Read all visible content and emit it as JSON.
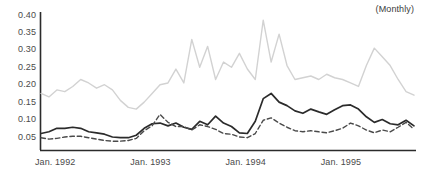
{
  "annotation": {
    "frequency_note": "(Monthly)"
  },
  "chart_data": {
    "type": "line",
    "title": "",
    "subtitle": "",
    "xlabel": "",
    "ylabel": "",
    "annotations": [
      "(Monthly)"
    ],
    "grid": false,
    "legend": "none",
    "ylim": [
      0.0,
      0.4
    ],
    "ytick_labels": [
      "0.40",
      "0.35",
      "0.30",
      "0.25",
      "0.20",
      "0.15",
      "0.10",
      "0.05"
    ],
    "yticks": [
      0.4,
      0.35,
      0.3,
      0.25,
      0.2,
      0.15,
      0.1,
      0.05
    ],
    "xtick_labels": [
      "Jan. 1992",
      "Jan. 1993",
      "Jan. 1994",
      "Jan. 1995"
    ],
    "xticks": [
      0,
      12,
      24,
      36
    ],
    "x_index": [
      0,
      1,
      2,
      3,
      4,
      5,
      6,
      7,
      8,
      9,
      10,
      11,
      12,
      13,
      14,
      15,
      16,
      17,
      18,
      19,
      20,
      21,
      22,
      23,
      24,
      25,
      26,
      27,
      28,
      29,
      30,
      31,
      32,
      33,
      34,
      35,
      36,
      37,
      38,
      39,
      40,
      41,
      42,
      43,
      44,
      45,
      46,
      47
    ],
    "series": [
      {
        "name": "light-gray-series",
        "style": "solid",
        "color": "#d2d2d2",
        "values": [
          0.175,
          0.165,
          0.185,
          0.18,
          0.195,
          0.215,
          0.205,
          0.19,
          0.2,
          0.185,
          0.155,
          0.135,
          0.13,
          0.15,
          0.175,
          0.2,
          0.205,
          0.245,
          0.205,
          0.33,
          0.25,
          0.31,
          0.215,
          0.265,
          0.25,
          0.29,
          0.245,
          0.215,
          0.385,
          0.265,
          0.345,
          0.255,
          0.215,
          0.22,
          0.225,
          0.215,
          0.23,
          0.22,
          0.215,
          0.205,
          0.195,
          0.255,
          0.305,
          0.28,
          0.255,
          0.215,
          0.18,
          0.17
        ]
      },
      {
        "name": "dark-solid-series",
        "style": "solid",
        "color": "#2b2b2b",
        "values": [
          0.06,
          0.065,
          0.075,
          0.075,
          0.078,
          0.075,
          0.065,
          0.062,
          0.058,
          0.05,
          0.048,
          0.048,
          0.055,
          0.075,
          0.088,
          0.09,
          0.082,
          0.09,
          0.078,
          0.072,
          0.095,
          0.085,
          0.11,
          0.09,
          0.08,
          0.062,
          0.06,
          0.095,
          0.16,
          0.175,
          0.15,
          0.14,
          0.125,
          0.118,
          0.13,
          0.122,
          0.115,
          0.128,
          0.14,
          0.142,
          0.13,
          0.108,
          0.092,
          0.1,
          0.088,
          0.085,
          0.098,
          0.082
        ]
      },
      {
        "name": "dark-dashed-series",
        "style": "dashed",
        "color": "#4a4a4a",
        "values": [
          0.048,
          0.044,
          0.046,
          0.05,
          0.052,
          0.052,
          0.048,
          0.044,
          0.04,
          0.038,
          0.038,
          0.04,
          0.046,
          0.068,
          0.082,
          0.115,
          0.092,
          0.08,
          0.08,
          0.07,
          0.085,
          0.08,
          0.072,
          0.06,
          0.058,
          0.05,
          0.048,
          0.06,
          0.098,
          0.105,
          0.09,
          0.078,
          0.068,
          0.065,
          0.068,
          0.065,
          0.062,
          0.068,
          0.075,
          0.09,
          0.082,
          0.07,
          0.062,
          0.07,
          0.065,
          0.078,
          0.092,
          0.072
        ]
      }
    ]
  }
}
